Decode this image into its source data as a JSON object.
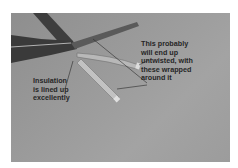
{
  "photo": {
    "description": "Grayscale photo of a cable with stripped wires fanning out",
    "background_color": "#9a9a9a"
  },
  "annotations": {
    "right": {
      "text": "This probably\nwill end up\nuntwisted, with\nthese wrapped\naround it"
    },
    "left": {
      "text": "Insulation\nis lined up\nexcellently"
    }
  }
}
